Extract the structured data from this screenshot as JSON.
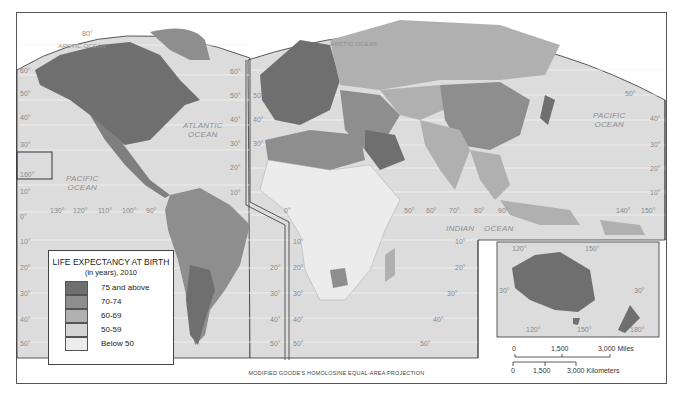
{
  "map": {
    "title": "LIFE EXPECTANCY AT BIRTH",
    "subtitle": "(in years), 2010",
    "projection": "MODIFIED GOODE'S HOMOLOSINE EQUAL-AREA PROJECTION",
    "colors": {
      "land_75_above": "#6f6f6f",
      "land_70_74": "#8e8e8e",
      "land_60_69": "#b0b0b0",
      "land_50_59": "#d5d5d5",
      "land_below_50": "#ececec",
      "ocean": "#dcdcdc",
      "graticule": "#f4f4f4"
    }
  },
  "legend": {
    "title": "LIFE EXPECTANCY AT BIRTH",
    "subtitle": "(in years), 2010",
    "items": [
      {
        "label": "75 and above",
        "color": "#6f6f6f"
      },
      {
        "label": "70-74",
        "color": "#8e8e8e"
      },
      {
        "label": "60-69",
        "color": "#b0b0b0"
      },
      {
        "label": "50-59",
        "color": "#d5d5d5"
      },
      {
        "label": "Below 50",
        "color": "#ececec"
      }
    ]
  },
  "oceans": {
    "arctic_west": "ARCTIC OCEAN",
    "arctic_east": "ARCTIC OCEAN",
    "atlantic_1": "ATLANTIC",
    "atlantic_2": "OCEAN",
    "pacific_west_1": "PACIFIC",
    "pacific_west_2": "OCEAN",
    "pacific_east_1": "PACIFIC",
    "pacific_east_2": "OCEAN",
    "indian_1": "INDIAN",
    "indian_2": "OCEAN"
  },
  "graticule_labels": {
    "lat_left": [
      "60°",
      "50°",
      "40°",
      "30°",
      "160°",
      "10°",
      "0°",
      "10°",
      "20°",
      "30°",
      "40°",
      "50°"
    ],
    "lat_mid_left": [
      "60°",
      "50°",
      "40°",
      "30°",
      "20°",
      "10°"
    ],
    "lat_mid_right": [
      "50°",
      "40°",
      "30°"
    ],
    "lat_south_mid_left": [
      "20°",
      "30°",
      "40°",
      "50°"
    ],
    "lat_south_mid_right": [
      "10°",
      "20°",
      "30°",
      "40°",
      "50°"
    ],
    "lat_south_right": [
      "10°",
      "20°",
      "30°",
      "40°",
      "50°"
    ],
    "lat_east": [
      "50°",
      "40°",
      "30°",
      "20°",
      "10°"
    ],
    "lon_america": [
      "130°",
      "120°",
      "110°",
      "100°",
      "90°"
    ],
    "lon_africa_asia": [
      "0°",
      "50°",
      "60°",
      "70°",
      "80°",
      "90°"
    ],
    "lon_pacific": [
      "140°",
      "150°"
    ],
    "arctic_lat": "80°",
    "inset_australia": [
      "120°",
      "150°",
      "30°",
      "30°",
      "120°",
      "150°",
      "180°"
    ],
    "indian_10": "10°"
  },
  "scale": {
    "miles": {
      "ticks": [
        "0",
        "1,500",
        "3,000 Miles"
      ]
    },
    "kilometers": {
      "ticks": [
        "0",
        "1,500",
        "3,000 Kilometers"
      ]
    }
  }
}
